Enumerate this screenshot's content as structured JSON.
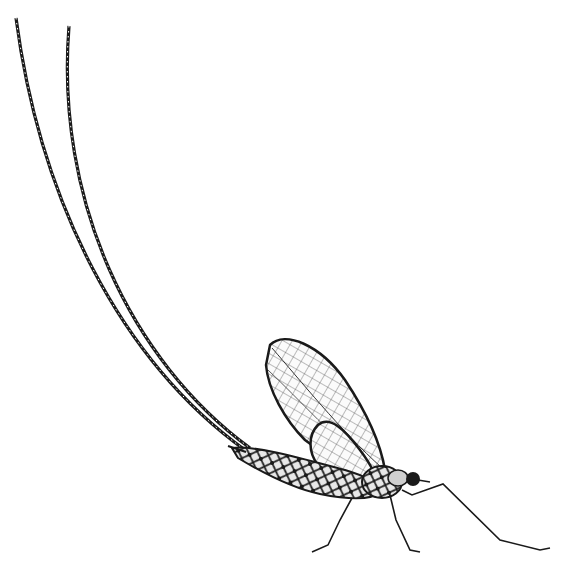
{
  "image": {
    "subject": "mayfly illustration",
    "style": "black ink engraving on white",
    "background": "#ffffff",
    "ink": "#1a1a1a"
  },
  "parts": {
    "tail_filaments": 2,
    "forewing": 1,
    "hindwing": 1,
    "abdomen": 1,
    "thorax": 1,
    "head": 1,
    "legs": 3
  }
}
